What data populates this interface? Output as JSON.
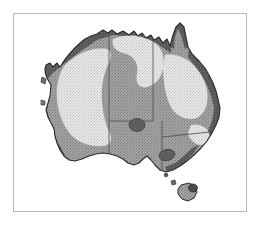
{
  "figure": {
    "type": "thematic-map",
    "region": "Australia",
    "style": "grayscale halftone / stippled print",
    "frame": {
      "border_color": "#b8b8b8",
      "background_color": "#ffffff",
      "x": 13,
      "y": 13,
      "width": 234,
      "height": 199
    }
  },
  "palette": {
    "page_background": "#ffffff",
    "frame_border": "#b8b8b8",
    "zone_light": "#e2e2e2",
    "zone_light_stipple": "#c9c9c9",
    "zone_medium": "#9b9b9b",
    "zone_medium_stipple": "#7e7e7e",
    "zone_dark": "#6a6a6a",
    "coast_outline": "#2a2a2a",
    "coast_band_dark": "#555555",
    "state_border": "#4a4a4a",
    "marker_fill": "#5e5e5e"
  },
  "zones": [
    {
      "id": "zone-interior-light",
      "label": "Light interior zone",
      "fill": "#e2e2e2",
      "description": "Large pale stippled arid interior covering most of Western Australia and the centre"
    },
    {
      "id": "zone-medium-central",
      "label": "Medium central zone",
      "fill": "#9b9b9b",
      "description": "Mid-grey lobe across the Northern Territory and South Australia"
    },
    {
      "id": "zone-coastal-medium",
      "label": "Medium coastal zone",
      "fill": "#9b9b9b",
      "description": "Mid-grey band following the southern, south-western and eastern coasts"
    },
    {
      "id": "zone-coastal-dark",
      "label": "Dark coastal fringe",
      "fill": "#555555",
      "description": "Narrow dark fringe along the northern, north-western and eastern seaboard"
    }
  ],
  "state_borders": [
    {
      "id": "border-wa-nt-sa",
      "label": "Western Australia eastern boundary"
    },
    {
      "id": "border-nt-qld",
      "label": "Northern Territory / Queensland boundary"
    },
    {
      "id": "border-nt-sa",
      "label": "Northern Territory / South Australia boundary"
    },
    {
      "id": "border-sa-nsw-vic",
      "label": "South Australia eastern boundary"
    },
    {
      "id": "border-qld-nsw",
      "label": "Queensland / New South Wales boundary"
    }
  ],
  "markers": [
    {
      "id": "marker-central",
      "label": "Central Australia marker",
      "fill": "#5e5e5e"
    },
    {
      "id": "marker-southeast",
      "label": "South-eastern marker",
      "fill": "#5e5e5e"
    },
    {
      "id": "marker-tasmania",
      "label": "Tasmania marker",
      "fill": "#4a4a4a"
    }
  ],
  "landmasses": [
    {
      "id": "mainland",
      "label": "Australian mainland"
    },
    {
      "id": "tasmania",
      "label": "Tasmania"
    },
    {
      "id": "king-island",
      "label": "King Island"
    },
    {
      "id": "islet-bass-strait",
      "label": "Bass Strait islet"
    }
  ]
}
